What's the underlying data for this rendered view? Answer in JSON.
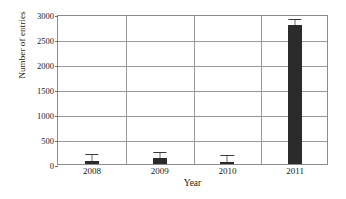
{
  "chart_data": {
    "type": "bar",
    "title": "",
    "xlabel": "Year",
    "ylabel": "Number of entries",
    "categories": [
      "2008",
      "2009",
      "2010",
      "2011"
    ],
    "values": [
      60,
      120,
      50,
      2790
    ],
    "errors": [
      190,
      170,
      170,
      160
    ],
    "ylim": [
      0,
      3000
    ],
    "yticks": [
      0,
      500,
      1000,
      1500,
      2000,
      2500,
      3000
    ],
    "ytick_labels": [
      "0",
      "500",
      "1000",
      "1500",
      "2000",
      "2500",
      "3000"
    ],
    "grid": "horizontal-and-vertical-category-separators",
    "legend": "none",
    "bar_color": "#2b2b2b",
    "frame_color": "#8c8c8c",
    "grid_color": "#9a9a9a",
    "background": "#ffffff"
  }
}
